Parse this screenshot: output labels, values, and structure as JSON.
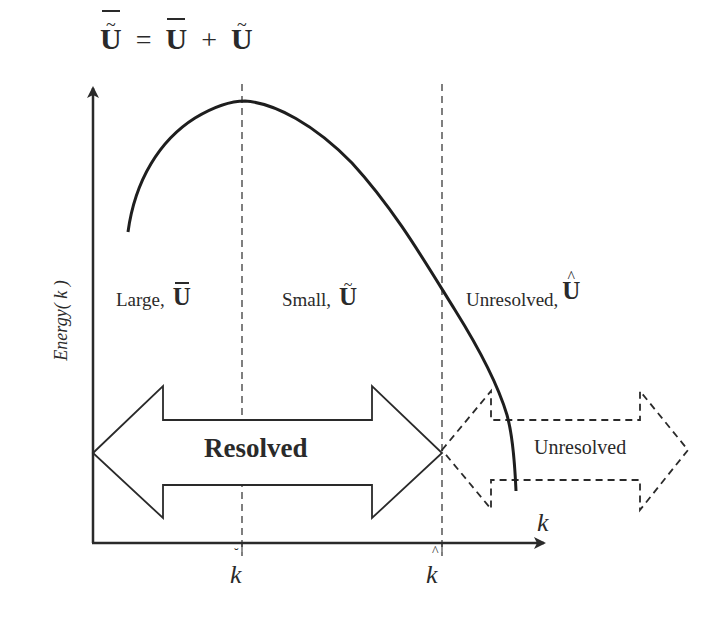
{
  "equation": {
    "lhs": "U",
    "lhs_accents": [
      "tilde",
      "overbar"
    ],
    "equals": "=",
    "term1": "U",
    "term1_accent": "overbar",
    "plus": "+",
    "term2": "U",
    "term2_accent": "tilde"
  },
  "axes": {
    "y_label": "Energy( k )",
    "x_label": "k",
    "x_ticks": [
      {
        "label": "k",
        "accent": "breve",
        "x": 242
      },
      {
        "label": "k",
        "accent": "hat",
        "x": 442
      }
    ]
  },
  "regions": [
    {
      "name": "Large,",
      "symbol": "U",
      "accent": "overbar"
    },
    {
      "name": "Small,",
      "symbol": "U",
      "accent": "tilde"
    },
    {
      "name": "Unresolved,",
      "symbol": "U",
      "accent": "hat"
    }
  ],
  "arrows": {
    "resolved": {
      "label": "Resolved",
      "style": "solid",
      "direction": "double"
    },
    "unresolved": {
      "label": "Unresolved",
      "style": "dashed",
      "direction": "double"
    }
  },
  "accent_glyphs": {
    "tilde": "~",
    "hat": "^",
    "breve": "˘"
  },
  "colors": {
    "ink": "#2a2a2a",
    "background": "#ffffff"
  },
  "curve": {
    "description": "energy spectrum: rises from low k to a peak near the first cutoff, then decays steeply past the second cutoff",
    "points": [
      [
        128,
        232
      ],
      [
        150,
        170
      ],
      [
        185,
        125
      ],
      [
        220,
        104
      ],
      [
        245,
        101
      ],
      [
        280,
        112
      ],
      [
        320,
        138
      ],
      [
        360,
        172
      ],
      [
        400,
        222
      ],
      [
        442,
        288
      ],
      [
        470,
        332
      ],
      [
        493,
        385
      ],
      [
        505,
        413
      ],
      [
        512,
        440
      ],
      [
        515,
        465
      ],
      [
        516,
        491
      ]
    ]
  }
}
